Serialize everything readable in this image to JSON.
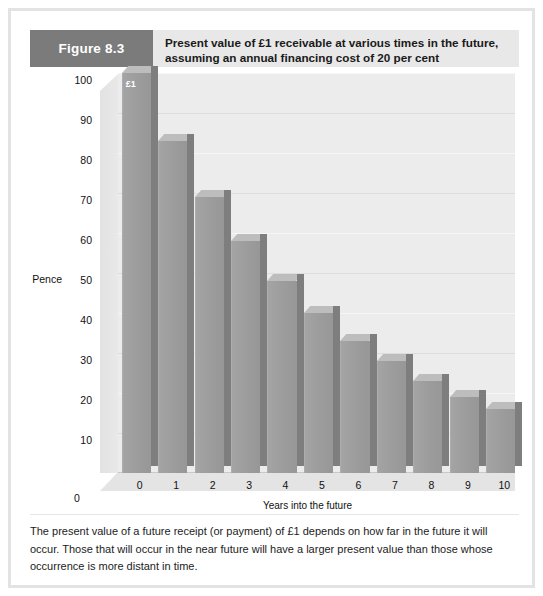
{
  "figure": {
    "tag": "Figure 8.3",
    "title_line1": "Present value of £1 receivable at various times in the future,",
    "title_line2": "assuming an annual financing cost of 20 per cent",
    "caption": "The present value of a future receipt (or payment) of £1 depends on how far in the future it will occur. Those that will occur in the near future will have a larger present value than those whose occurrence is more distant in time.",
    "colors": {
      "tag_background": "#7b7b7b",
      "header_background": "#e8e8e8",
      "bar_face": "#9c9c9c",
      "bar_top": "#bdbdbd",
      "bar_side": "#7e7e7e",
      "plot_background": "#ececec",
      "frame_border": "#e3e3e3"
    }
  },
  "chart_data": {
    "type": "bar",
    "title": "Present value of £1 receivable at various times in the future, assuming an annual financing cost of 20 per cent",
    "xlabel": "Years into the future",
    "ylabel": "Pence",
    "categories": [
      "0",
      "1",
      "2",
      "3",
      "4",
      "5",
      "6",
      "7",
      "8",
      "9",
      "10"
    ],
    "values": [
      100,
      83,
      69,
      58,
      48,
      40,
      33,
      28,
      23,
      19,
      16
    ],
    "ylim": [
      0,
      100
    ],
    "yticks": [
      0,
      10,
      20,
      30,
      40,
      50,
      60,
      70,
      80,
      90,
      100
    ],
    "ytick_labels": [
      "0",
      "10",
      "20",
      "30",
      "40",
      "50",
      "60",
      "70",
      "80",
      "90",
      "100"
    ],
    "xtick_labels": [
      "0",
      "1",
      "2",
      "3",
      "4",
      "5",
      "6",
      "7",
      "8",
      "9",
      "10"
    ],
    "grid": true,
    "legend": null,
    "annotations": [
      {
        "text": "£1",
        "category": "0",
        "value": 100
      }
    ],
    "style": "3d-column"
  }
}
